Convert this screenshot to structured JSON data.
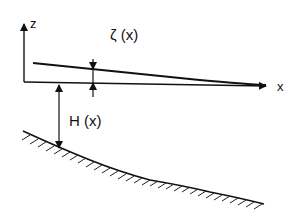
{
  "diagram": {
    "type": "shallow-water-wave-profile",
    "labels": {
      "z_axis": "z",
      "x_axis": "x",
      "surface_elevation": "ζ (x)",
      "depth": "H (x)"
    },
    "colors": {
      "stroke": "#111111",
      "background": "#ffffff"
    },
    "elements": [
      "z-axis with arrow",
      "x-axis with arrow (mean water level)",
      "free surface curve decaying toward x-axis",
      "surface elevation double arrow at x≈93",
      "depth double arrow H(x) at x≈59",
      "sloping sea bed with hatching"
    ]
  }
}
